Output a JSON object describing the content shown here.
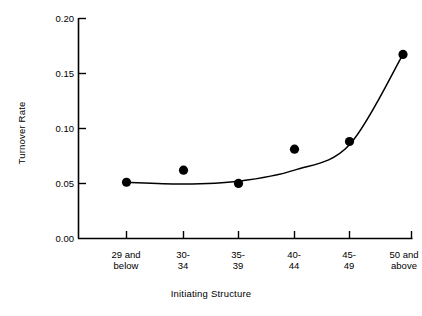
{
  "chart_data": {
    "type": "scatter",
    "title": "",
    "xlabel": "Initiating Structure",
    "ylabel": "Turnover Rate",
    "categories": [
      "29 and below",
      "30-34",
      "35-39",
      "40-44",
      "45-49",
      "50 and above"
    ],
    "values": [
      0.051,
      0.062,
      0.05,
      0.081,
      0.088,
      0.167
    ],
    "series": [
      {
        "name": "Turnover Rate",
        "values": [
          0.051,
          0.062,
          0.05,
          0.081,
          0.088,
          0.167
        ]
      },
      {
        "name": "Fitted curve",
        "values": [
          0.051,
          0.0495,
          0.052,
          0.062,
          0.085,
          0.167
        ]
      }
    ],
    "ylim": [
      0.0,
      0.2
    ],
    "yticks": [
      0.0,
      0.05,
      0.1,
      0.15,
      0.2
    ],
    "ytick_labels": [
      "0.00",
      "0.05",
      "0.10",
      "0.15",
      "0.20"
    ],
    "xtick_labels": [
      [
        "29 and",
        "below"
      ],
      [
        "30-",
        "34"
      ],
      [
        "35-",
        "39"
      ],
      [
        "40-",
        "44"
      ],
      [
        "45-",
        "49"
      ],
      [
        "50 and",
        "above"
      ]
    ],
    "grid": false,
    "legend": "none",
    "marker": "filled-circle",
    "marker_color": "#000000",
    "line_color": "#000000",
    "axis_color": "#000000",
    "background": "#ffffff"
  },
  "axes": {
    "y_tick_0": "0.00",
    "y_tick_1": "0.05",
    "y_tick_2": "0.10",
    "y_tick_3": "0.15",
    "y_tick_4": "0.20",
    "y_axis_title": "Turnover Rate",
    "x_axis_title": "Initiating Structure",
    "x_tick_0_line1": "29 and",
    "x_tick_0_line2": "below",
    "x_tick_1_line1": "30-",
    "x_tick_1_line2": "34",
    "x_tick_2_line1": "35-",
    "x_tick_2_line2": "39",
    "x_tick_3_line1": "40-",
    "x_tick_3_line2": "44",
    "x_tick_4_line1": "45-",
    "x_tick_4_line2": "49",
    "x_tick_5_line1": "50 and",
    "x_tick_5_line2": "above"
  }
}
